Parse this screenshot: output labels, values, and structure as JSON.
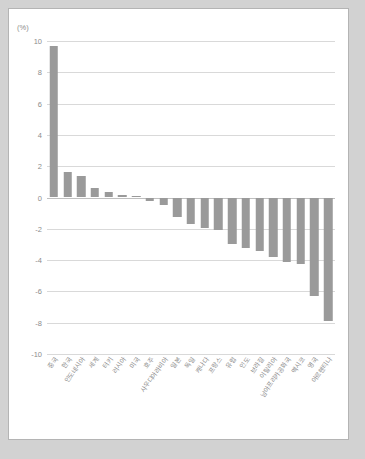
{
  "chart_data": {
    "type": "bar",
    "title": "",
    "subtitle": "",
    "xlabel": "",
    "ylabel": "",
    "unit_label": "(%)",
    "ylim": [
      -10,
      10
    ],
    "ytick_step": 2,
    "yticks": [
      "10",
      "8",
      "6",
      "4",
      "2",
      "0",
      "-2",
      "-4",
      "-6",
      "-8",
      "-10"
    ],
    "grid": true,
    "legend": "none",
    "bar_color": "#9a9a9a",
    "gridline_color": "#d9d9d9",
    "axis_text_color": "#8c8c8c",
    "categories": [
      "중국",
      "한국",
      "인도네시아",
      "세계",
      "터키",
      "러시아",
      "미국",
      "호주",
      "사우디아라비아",
      "일본",
      "독일",
      "캐나다",
      "프랑스",
      "유럽",
      "인도",
      "브라질",
      "이탈리아",
      "남아프리카공화국",
      "멕시코",
      "영국",
      "아르헨티나"
    ],
    "values": [
      9.7,
      1.6,
      1.4,
      0.6,
      0.35,
      0.15,
      0.1,
      -0.2,
      -0.5,
      -1.25,
      -1.7,
      -1.95,
      -2.1,
      -3.0,
      -3.2,
      -3.45,
      -3.8,
      -4.1,
      -4.25,
      -6.3,
      -7.9
    ]
  }
}
